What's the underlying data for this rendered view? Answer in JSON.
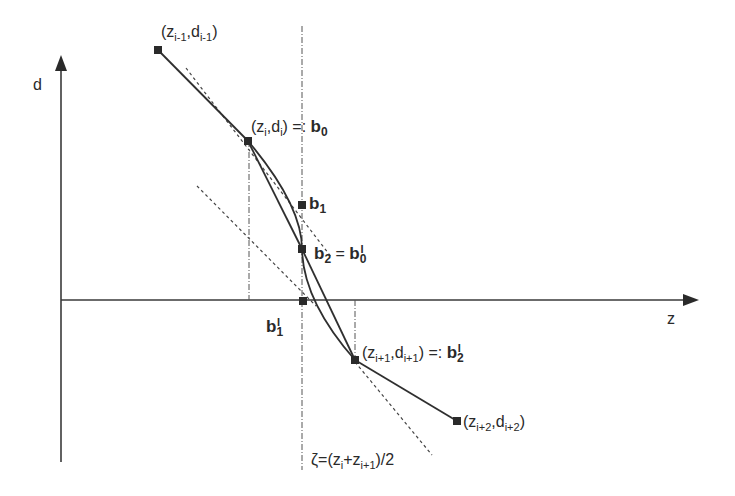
{
  "diagram": {
    "axes": {
      "y_label": "d",
      "x_label": "z"
    },
    "points": [
      {
        "id": "p_im1",
        "label_base": "(z",
        "sub1": "i-1",
        "mid": ",d",
        "sub2": "i-1",
        "tail": ")",
        "x": 158,
        "y": 50
      },
      {
        "id": "p_i",
        "label_base": "(z",
        "sub1": "i",
        "mid": ",d",
        "sub2": "i",
        "tail": ") =: ",
        "bold": "b",
        "bold_sub": "0",
        "x": 248,
        "y": 141
      },
      {
        "id": "b1",
        "bold": "b",
        "bold_sub": "1",
        "x": 302,
        "y": 205
      },
      {
        "id": "b2",
        "bold": "b",
        "bold_sub": "2",
        "eq": " = ",
        "bold2": "b",
        "bold2_sub": "0",
        "bold2_sup": "I",
        "x": 302,
        "y": 249
      },
      {
        "id": "b1p",
        "bold": "b",
        "bold_sub": "1",
        "bold_sup": "I",
        "x": 303,
        "y": 301
      },
      {
        "id": "p_ip1",
        "label_base": "(z",
        "sub1": "i+1",
        "mid": ",d",
        "sub2": "i+1",
        "tail": ") =: ",
        "bold": "b",
        "bold_sub": "2",
        "bold_sup": "I",
        "x": 355,
        "y": 360
      },
      {
        "id": "p_ip2",
        "label_base": "(z",
        "sub1": "i+2",
        "mid": ",d",
        "sub2": "i+2",
        "tail": ")",
        "x": 457,
        "y": 421
      }
    ],
    "zeta_label": {
      "prefix": "ζ=(z",
      "sub1": "i",
      "mid": "+z",
      "sub2": "i+1",
      "tail": ")/2"
    },
    "colors": {
      "line": "#2f2f2f",
      "axis": "#3a3a3a",
      "text": "#2a2a2a"
    }
  }
}
